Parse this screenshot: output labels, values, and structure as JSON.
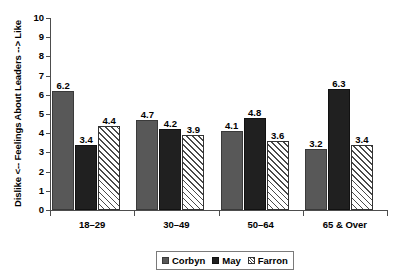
{
  "chart_data": {
    "type": "bar",
    "title": "",
    "subtitle": "",
    "xlabel": "",
    "ylabel": "Dislike <-- Feelings About Leaders --> Like",
    "ylim": [
      0,
      10
    ],
    "ytick_step": 1,
    "yticks": [
      "10",
      "9",
      "8",
      "7",
      "6",
      "5",
      "4",
      "3",
      "2",
      "1",
      "0"
    ],
    "grid": false,
    "legend_position": "bottom-center",
    "categories": [
      "18–29",
      "30–49",
      "50–64",
      "65 & Over"
    ],
    "series": [
      {
        "name": "Corbyn",
        "color": "#585858",
        "fill": "solid-dark-gray",
        "values": [
          6.2,
          4.7,
          4.1,
          3.2
        ],
        "labels": [
          "6.2",
          "4.7",
          "4.1",
          "3.2"
        ]
      },
      {
        "name": "May",
        "color": "#202020",
        "fill": "solid-black",
        "values": [
          3.4,
          4.2,
          4.8,
          6.3
        ],
        "labels": [
          "3.4",
          "4.2",
          "4.8",
          "6.3"
        ]
      },
      {
        "name": "Farron",
        "color": "#ffffff",
        "fill": "diagonal-hatch",
        "values": [
          4.4,
          3.9,
          3.6,
          3.4
        ],
        "labels": [
          "4.4",
          "3.9",
          "3.6",
          "3.4"
        ]
      }
    ]
  },
  "legend": {
    "items": [
      {
        "label": "Corbyn"
      },
      {
        "label": "May"
      },
      {
        "label": "Farron"
      }
    ]
  },
  "axes": {
    "y_title": "Dislike <-- Feelings About Leaders --> Like"
  }
}
